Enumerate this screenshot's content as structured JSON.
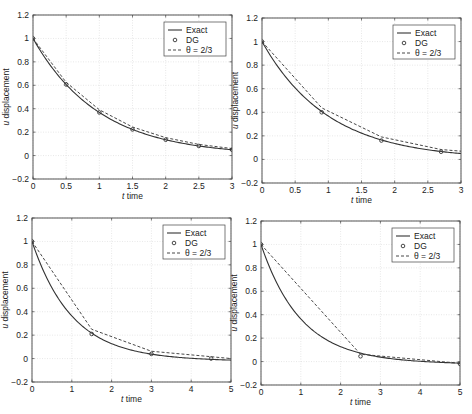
{
  "figure": {
    "panels": 4,
    "layout": "2x2",
    "colors": {
      "exact": "#333333",
      "dg": "#333333",
      "theta": "#333333",
      "grid": "#d8d8d8",
      "axes": "#444444"
    }
  },
  "chart_data": [
    {
      "type": "line",
      "title": "",
      "xlabel": "t time",
      "ylabel": "u displacement",
      "xlim": [
        0,
        3
      ],
      "ylim": [
        -0.2,
        1.2
      ],
      "xticks": [
        "0",
        "0.5",
        "1",
        "1.5",
        "2",
        "2.5",
        "3"
      ],
      "yticks": [
        "-0.2",
        "0",
        "0.2",
        "0.4",
        "0.6",
        "0.8",
        "1",
        "1.2"
      ],
      "grid": true,
      "legend": {
        "position": "upper right",
        "entries": [
          "Exact",
          "DG",
          "θ = 2/3"
        ]
      },
      "step": 0.5,
      "series": [
        {
          "name": "Exact",
          "style": "solid",
          "function": "exp(-t)"
        },
        {
          "name": "DG",
          "style": "circle-markers",
          "x": [
            0,
            0.5,
            1,
            1.5,
            2,
            2.5,
            3
          ],
          "values": [
            1,
            0.607,
            0.368,
            0.223,
            0.135,
            0.082,
            0.05
          ]
        },
        {
          "name": "θ = 2/3",
          "style": "dashed",
          "x": [
            0,
            0.5,
            1,
            1.5,
            2,
            2.5,
            3
          ],
          "values": [
            1,
            0.625,
            0.391,
            0.244,
            0.153,
            0.095,
            0.06
          ]
        }
      ]
    },
    {
      "type": "line",
      "title": "",
      "xlabel": "t time",
      "ylabel": "u displacement",
      "xlim": [
        0,
        3
      ],
      "ylim": [
        -0.2,
        1.2
      ],
      "xticks": [
        "0",
        "0.5",
        "1",
        "1.5",
        "2",
        "2.5",
        "3"
      ],
      "yticks": [
        "-0.2",
        "0",
        "0.2",
        "0.4",
        "0.6",
        "0.8",
        "1",
        "1.2"
      ],
      "grid": true,
      "legend": {
        "position": "upper right",
        "entries": [
          "Exact",
          "DG",
          "θ = 2/3"
        ]
      },
      "step": 0.9,
      "series": [
        {
          "name": "Exact",
          "style": "solid",
          "function": "exp(-t)"
        },
        {
          "name": "DG",
          "style": "circle-markers",
          "x": [
            0,
            0.9,
            1.8,
            2.7
          ],
          "values": [
            1,
            0.4,
            0.16,
            0.065
          ]
        },
        {
          "name": "θ = 2/3",
          "style": "dashed",
          "x": [
            0,
            0.9,
            1.8,
            2.7,
            3
          ],
          "values": [
            1,
            0.4375,
            0.191,
            0.084,
            0.07
          ]
        }
      ]
    },
    {
      "type": "line",
      "title": "",
      "xlabel": "t time",
      "ylabel": "u displacement",
      "xlim": [
        0,
        5
      ],
      "ylim": [
        -0.2,
        1.2
      ],
      "xticks": [
        "0",
        "1",
        "2",
        "3",
        "4",
        "5"
      ],
      "yticks": [
        "-0.2",
        "0",
        "0.2",
        "0.4",
        "0.6",
        "0.8",
        "1",
        "1.2"
      ],
      "grid": true,
      "legend": {
        "position": "upper right",
        "entries": [
          "Exact",
          "DG",
          "θ = 2/3"
        ]
      },
      "step": 1.5,
      "series": [
        {
          "name": "Exact",
          "style": "solid",
          "function": "exp(-t)"
        },
        {
          "name": "DG",
          "style": "circle-markers",
          "x": [
            0,
            1.5,
            3,
            4.5
          ],
          "values": [
            1,
            0.21,
            0.04,
            0.0
          ]
        },
        {
          "name": "θ = 2/3",
          "style": "dashed",
          "x": [
            0,
            1.5,
            3,
            4.5,
            5
          ],
          "values": [
            1,
            0.25,
            0.0625,
            0.016,
            0.0
          ]
        }
      ]
    },
    {
      "type": "line",
      "title": "",
      "xlabel": "t time",
      "ylabel": "u displacement",
      "xlim": [
        0,
        5
      ],
      "ylim": [
        -0.2,
        1.2
      ],
      "xticks": [
        "0",
        "1",
        "2",
        "3",
        "4",
        "5"
      ],
      "yticks": [
        "-0.2",
        "0",
        "0.2",
        "0.4",
        "0.6",
        "0.8",
        "1",
        "1.2"
      ],
      "grid": true,
      "legend": {
        "position": "upper right",
        "entries": [
          "Exact",
          "DG",
          "θ = 2/3"
        ]
      },
      "step": 2.5,
      "series": [
        {
          "name": "Exact",
          "style": "solid",
          "function": "exp(-t)"
        },
        {
          "name": "DG",
          "style": "circle-markers",
          "x": [
            0,
            2.5,
            5
          ],
          "values": [
            1,
            0.045,
            -0.02
          ]
        },
        {
          "name": "θ = 2/3",
          "style": "dashed",
          "x": [
            0,
            2.5,
            5
          ],
          "values": [
            1,
            0.0625,
            -0.015
          ]
        }
      ]
    }
  ],
  "panels": [
    {
      "box": [
        33,
        15,
        232,
        179
      ]
    },
    {
      "box": [
        262,
        18,
        461,
        183
      ]
    },
    {
      "box": [
        32,
        218,
        231,
        382
      ]
    },
    {
      "box": [
        261,
        221,
        460,
        385
      ]
    }
  ]
}
